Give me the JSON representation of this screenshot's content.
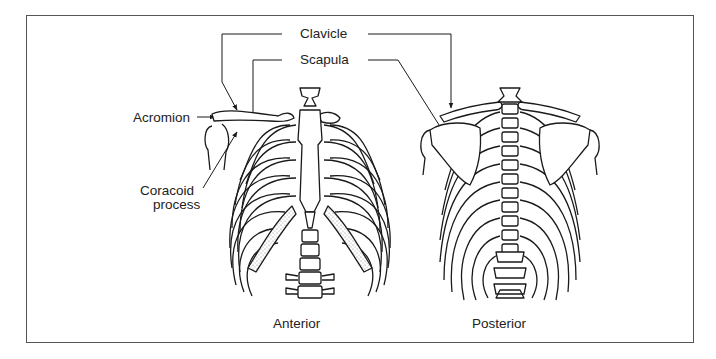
{
  "figure": {
    "labels": {
      "clavicle": "Clavicle",
      "scapula": "Scapula",
      "acromion": "Acromion",
      "coracoid_line1": "Coracoid",
      "coracoid_line2": "process"
    },
    "captions": {
      "anterior": "Anterior",
      "posterior": "Posterior"
    },
    "colors": {
      "line": "#1a1a1a",
      "frame": "#555555",
      "background": "#ffffff",
      "cartilage_stipple": "#bdbdbd"
    }
  }
}
